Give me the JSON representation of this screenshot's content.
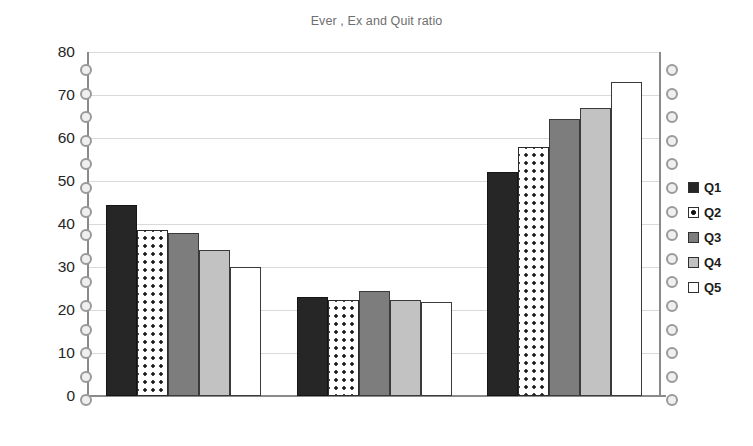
{
  "chart_data": {
    "type": "bar",
    "title": "Ever , Ex and Quit ratio",
    "xlabel": "",
    "ylabel": "",
    "categories": [
      "Ever",
      "Ex",
      "Quit ratio"
    ],
    "series": [
      {
        "name": "Q1",
        "values": [
          44.5,
          23.0,
          52.0
        ],
        "fill": "solid-black",
        "color": "#262626"
      },
      {
        "name": "Q2",
        "values": [
          38.5,
          22.3,
          58.0
        ],
        "fill": "dotted-white",
        "color": "#ffffff"
      },
      {
        "name": "Q3",
        "values": [
          38.0,
          24.5,
          64.5
        ],
        "fill": "dark-gray",
        "color": "#7d7d7d"
      },
      {
        "name": "Q4",
        "values": [
          34.0,
          22.3,
          67.0
        ],
        "fill": "light-gray",
        "color": "#c2c2c2"
      },
      {
        "name": "Q5",
        "values": [
          30.0,
          21.8,
          73.0
        ],
        "fill": "white",
        "color": "#ffffff"
      }
    ],
    "ylim": [
      0,
      80
    ],
    "yticks": [
      0,
      10,
      20,
      30,
      40,
      50,
      60,
      70,
      80
    ],
    "ytick_labels": [
      "0",
      "10",
      "20",
      "30",
      "40",
      "50",
      "60",
      "70",
      "80"
    ],
    "grid": true,
    "grid_axis": "y",
    "legend_position": "right",
    "legend_entries": [
      "Q1",
      "Q2",
      "Q3",
      "Q4",
      "Q5"
    ]
  },
  "artifacts": {
    "binding_holes_left": 15,
    "binding_holes_right": 15
  }
}
